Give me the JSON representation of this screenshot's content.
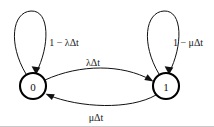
{
  "diagram": {
    "type": "state-transition-diagram",
    "background_color": "#ffffff",
    "stroke_color": "#111111",
    "nodes": [
      {
        "id": "state-0",
        "label": "0",
        "cx": 33,
        "cy": 86,
        "r": 13
      },
      {
        "id": "state-1",
        "label": "1",
        "cx": 166,
        "cy": 86,
        "r": 13
      }
    ],
    "self_loops": [
      {
        "id": "loop-state-0",
        "node": "0",
        "label": "1 − λΔt",
        "label_x": 64,
        "label_y": 42
      },
      {
        "id": "loop-state-1",
        "node": "1",
        "label": "1 − μΔt",
        "label_x": 188,
        "label_y": 42
      }
    ],
    "transitions": [
      {
        "id": "edge-0-to-1",
        "from": "0",
        "to": "1",
        "label": "λΔt",
        "label_x": 93,
        "label_y": 62,
        "direction": "rightward"
      },
      {
        "id": "edge-1-to-0",
        "from": "1",
        "to": "0",
        "label": "μΔt",
        "label_x": 96,
        "label_y": 117,
        "direction": "leftward"
      }
    ]
  }
}
